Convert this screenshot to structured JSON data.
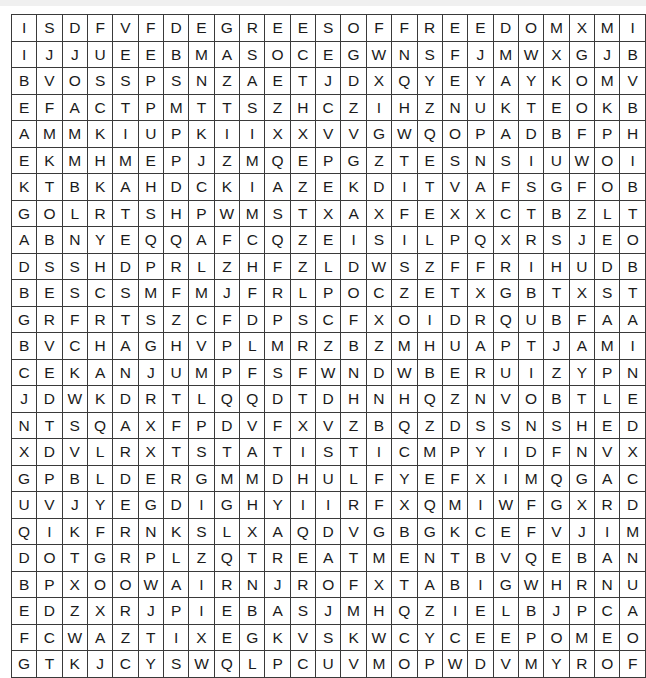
{
  "puzzle": {
    "type": "word-search-grid",
    "rows": 25,
    "columns": 25,
    "cell_text_color": "#1a1a1a",
    "grid_line_color": "#3a3a3a",
    "background_color": "#ffffff",
    "grid": [
      [
        "I",
        "S",
        "D",
        "F",
        "V",
        "F",
        "D",
        "E",
        "G",
        "R",
        "E",
        "E",
        "S",
        "O",
        "F",
        "F",
        "R",
        "E",
        "E",
        "D",
        "O",
        "M",
        "X",
        "M",
        "I"
      ],
      [
        "I",
        "J",
        "J",
        "U",
        "E",
        "E",
        "B",
        "M",
        "A",
        "S",
        "O",
        "C",
        "E",
        "G",
        "W",
        "N",
        "S",
        "F",
        "J",
        "M",
        "W",
        "X",
        "G",
        "J",
        "B"
      ],
      [
        "B",
        "V",
        "O",
        "S",
        "S",
        "P",
        "S",
        "N",
        "Z",
        "A",
        "E",
        "T",
        "J",
        "D",
        "X",
        "Q",
        "Y",
        "E",
        "Y",
        "A",
        "Y",
        "K",
        "O",
        "M",
        "V"
      ],
      [
        "E",
        "F",
        "A",
        "C",
        "T",
        "P",
        "M",
        "T",
        "T",
        "S",
        "Z",
        "H",
        "C",
        "Z",
        "I",
        "H",
        "Z",
        "N",
        "U",
        "K",
        "T",
        "E",
        "O",
        "K",
        "B"
      ],
      [
        "A",
        "M",
        "M",
        "K",
        "I",
        "U",
        "P",
        "K",
        "I",
        "I",
        "X",
        "X",
        "V",
        "V",
        "G",
        "W",
        "Q",
        "O",
        "P",
        "A",
        "D",
        "B",
        "F",
        "P",
        "H"
      ],
      [
        "E",
        "K",
        "M",
        "H",
        "M",
        "E",
        "P",
        "J",
        "Z",
        "M",
        "Q",
        "E",
        "P",
        "G",
        "Z",
        "T",
        "E",
        "S",
        "N",
        "S",
        "I",
        "U",
        "W",
        "O",
        "I"
      ],
      [
        "K",
        "T",
        "B",
        "K",
        "A",
        "H",
        "D",
        "C",
        "K",
        "I",
        "A",
        "Z",
        "E",
        "K",
        "D",
        "I",
        "T",
        "V",
        "A",
        "F",
        "S",
        "G",
        "F",
        "O",
        "B"
      ],
      [
        "G",
        "O",
        "L",
        "R",
        "T",
        "S",
        "H",
        "P",
        "W",
        "M",
        "S",
        "T",
        "X",
        "A",
        "X",
        "F",
        "E",
        "X",
        "X",
        "C",
        "T",
        "B",
        "Z",
        "L",
        "T"
      ],
      [
        "A",
        "B",
        "N",
        "Y",
        "E",
        "Q",
        "Q",
        "A",
        "F",
        "C",
        "Q",
        "Z",
        "E",
        "I",
        "S",
        "I",
        "L",
        "P",
        "Q",
        "X",
        "R",
        "S",
        "J",
        "E",
        "O"
      ],
      [
        "D",
        "S",
        "S",
        "H",
        "D",
        "P",
        "R",
        "L",
        "Z",
        "H",
        "F",
        "Z",
        "L",
        "D",
        "W",
        "S",
        "Z",
        "F",
        "F",
        "R",
        "I",
        "H",
        "U",
        "D",
        "B"
      ],
      [
        "B",
        "E",
        "S",
        "C",
        "S",
        "M",
        "F",
        "M",
        "J",
        "F",
        "R",
        "L",
        "P",
        "O",
        "C",
        "Z",
        "E",
        "T",
        "X",
        "G",
        "B",
        "T",
        "X",
        "S",
        "T"
      ],
      [
        "G",
        "R",
        "F",
        "R",
        "T",
        "S",
        "Z",
        "C",
        "F",
        "D",
        "P",
        "S",
        "C",
        "F",
        "X",
        "O",
        "I",
        "D",
        "R",
        "Q",
        "U",
        "B",
        "F",
        "A",
        "A"
      ],
      [
        "B",
        "V",
        "C",
        "H",
        "A",
        "G",
        "H",
        "V",
        "P",
        "L",
        "M",
        "R",
        "Z",
        "B",
        "Z",
        "M",
        "H",
        "U",
        "A",
        "P",
        "T",
        "J",
        "A",
        "M",
        "I"
      ],
      [
        "C",
        "E",
        "K",
        "A",
        "N",
        "J",
        "U",
        "M",
        "P",
        "F",
        "S",
        "F",
        "W",
        "N",
        "D",
        "W",
        "B",
        "E",
        "R",
        "U",
        "I",
        "Z",
        "Y",
        "P",
        "N"
      ],
      [
        "J",
        "D",
        "W",
        "K",
        "D",
        "R",
        "T",
        "L",
        "Q",
        "Q",
        "D",
        "T",
        "D",
        "H",
        "N",
        "H",
        "Q",
        "Z",
        "N",
        "V",
        "O",
        "B",
        "T",
        "L",
        "E"
      ],
      [
        "N",
        "T",
        "S",
        "Q",
        "A",
        "X",
        "F",
        "P",
        "D",
        "V",
        "F",
        "X",
        "V",
        "Z",
        "B",
        "Q",
        "Z",
        "D",
        "S",
        "S",
        "N",
        "S",
        "H",
        "E",
        "D"
      ],
      [
        "X",
        "D",
        "V",
        "L",
        "R",
        "X",
        "T",
        "S",
        "T",
        "A",
        "T",
        "I",
        "S",
        "T",
        "I",
        "C",
        "M",
        "P",
        "Y",
        "I",
        "D",
        "F",
        "N",
        "V",
        "X"
      ],
      [
        "G",
        "P",
        "B",
        "L",
        "D",
        "E",
        "R",
        "G",
        "M",
        "M",
        "D",
        "H",
        "U",
        "L",
        "F",
        "Y",
        "E",
        "F",
        "X",
        "I",
        "M",
        "Q",
        "G",
        "A",
        "C"
      ],
      [
        "U",
        "V",
        "J",
        "Y",
        "E",
        "G",
        "D",
        "I",
        "G",
        "H",
        "Y",
        "I",
        "I",
        "R",
        "F",
        "X",
        "Q",
        "M",
        "I",
        "W",
        "F",
        "G",
        "X",
        "R",
        "D"
      ],
      [
        "Q",
        "I",
        "K",
        "F",
        "R",
        "N",
        "K",
        "S",
        "L",
        "X",
        "A",
        "Q",
        "D",
        "V",
        "G",
        "B",
        "G",
        "K",
        "C",
        "E",
        "F",
        "V",
        "J",
        "I",
        "M"
      ],
      [
        "D",
        "O",
        "T",
        "G",
        "R",
        "P",
        "L",
        "Z",
        "Q",
        "T",
        "R",
        "E",
        "A",
        "T",
        "M",
        "E",
        "N",
        "T",
        "B",
        "V",
        "Q",
        "E",
        "B",
        "A",
        "N"
      ],
      [
        "B",
        "P",
        "X",
        "O",
        "O",
        "W",
        "A",
        "I",
        "R",
        "N",
        "J",
        "R",
        "O",
        "F",
        "X",
        "T",
        "A",
        "B",
        "I",
        "G",
        "W",
        "H",
        "R",
        "N",
        "U"
      ],
      [
        "E",
        "D",
        "Z",
        "X",
        "R",
        "J",
        "P",
        "I",
        "E",
        "B",
        "A",
        "S",
        "J",
        "M",
        "H",
        "Q",
        "Z",
        "I",
        "E",
        "L",
        "B",
        "J",
        "P",
        "C",
        "A"
      ],
      [
        "F",
        "C",
        "W",
        "A",
        "Z",
        "T",
        "I",
        "X",
        "E",
        "G",
        "K",
        "V",
        "S",
        "K",
        "W",
        "C",
        "Y",
        "C",
        "E",
        "E",
        "P",
        "O",
        "M",
        "E",
        "O"
      ],
      [
        "G",
        "T",
        "K",
        "J",
        "C",
        "Y",
        "S",
        "W",
        "Q",
        "L",
        "P",
        "C",
        "U",
        "V",
        "M",
        "O",
        "P",
        "W",
        "D",
        "V",
        "M",
        "Y",
        "R",
        "O",
        "F"
      ]
    ]
  }
}
